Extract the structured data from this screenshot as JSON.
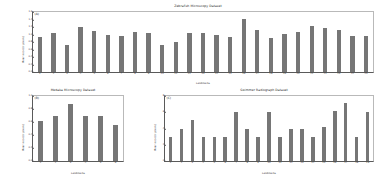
{
  "figure": {
    "background": "#ffffff",
    "bar_color": "#767676",
    "axis_color": "#5a5a5a"
  },
  "chart_data": [
    {
      "type": "bar",
      "panel_letter": "(A)",
      "title": "Zebrafish Microscopy Dataset",
      "xlabel": "Landmarks",
      "ylabel": "Mean error (in pixels)",
      "grid": false,
      "legend": "none",
      "ylim": [
        0.0,
        1.6
      ],
      "yticks": [
        "0.0",
        "0.2",
        "0.4",
        "0.6",
        "0.8",
        "1.0",
        "1.2",
        "1.4",
        "1.6"
      ],
      "categories": [
        "1",
        "2",
        "3",
        "4",
        "5",
        "6",
        "7",
        "8",
        "9",
        "10",
        "11",
        "12",
        "13",
        "14",
        "15",
        "16",
        "17",
        "18",
        "19",
        "20",
        "21",
        "22",
        "23",
        "24",
        "25"
      ],
      "values": [
        0.93,
        1.04,
        0.72,
        1.19,
        1.1,
        0.99,
        0.95,
        1.08,
        1.05,
        0.73,
        0.8,
        1.05,
        1.05,
        0.99,
        0.93,
        1.42,
        1.11,
        0.92,
        1.01,
        1.07,
        1.22,
        1.18,
        1.13,
        0.96,
        0.95
      ]
    },
    {
      "type": "bar",
      "panel_letter": "(B)",
      "title": "Medaka Microscopy Dataset",
      "xlabel": "Landmarks",
      "ylabel": "Mean error (in pixels)",
      "grid": false,
      "legend": "none",
      "ylim": [
        0.0,
        1.0
      ],
      "yticks": [
        "0.0",
        "0.2",
        "0.4",
        "0.6",
        "0.8",
        "1.0"
      ],
      "categories": [
        "1",
        "2",
        "3",
        "4",
        "5",
        "6"
      ],
      "values": [
        0.62,
        0.7,
        0.88,
        0.7,
        0.7,
        0.56
      ]
    },
    {
      "type": "bar",
      "panel_letter": "(C)",
      "title": "Swimmer Radiograph Dataset",
      "xlabel": "Landmarks",
      "ylabel": "Mean error (in pixels)",
      "grid": false,
      "legend": "none",
      "ylim": [
        0,
        8
      ],
      "yticks": [
        "0",
        "2",
        "4",
        "6",
        "8"
      ],
      "categories": [
        "1",
        "2",
        "3",
        "4",
        "5",
        "6",
        "7",
        "8",
        "9",
        "10",
        "11",
        "12",
        "13",
        "14",
        "15",
        "16",
        "17",
        "18",
        "19"
      ],
      "values": [
        3.0,
        4.0,
        5.0,
        3.0,
        3.0,
        3.0,
        6.0,
        4.0,
        3.0,
        6.0,
        3.0,
        4.0,
        4.0,
        3.0,
        4.2,
        6.2,
        7.1,
        3.0,
        6.0
      ]
    }
  ]
}
